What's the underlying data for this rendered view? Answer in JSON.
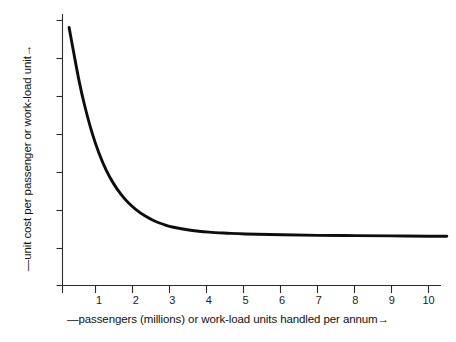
{
  "chart_data": {
    "type": "line",
    "title": "",
    "subtitle": "",
    "xlabel": "—passengers (millions) or work-load units handled per annum→",
    "ylabel": "—unit cost per passenger or work-load unit→",
    "xlabel_prefix_dash": "—",
    "xlabel_arrow": "→",
    "ylabel_prefix_dash": "—",
    "ylabel_arrow": "→",
    "grid": false,
    "legend": null,
    "legend_position": "none",
    "xlim": [
      0,
      10.8
    ],
    "ylim": [
      0,
      1
    ],
    "x_tick_labels": [
      "1",
      "2",
      "3",
      "4",
      "5",
      "6",
      "7",
      "8",
      "9",
      "10"
    ],
    "x_tick_values": [
      1,
      2,
      3,
      4,
      5,
      6,
      7,
      8,
      9,
      10
    ],
    "y_tick_labels": [
      "",
      "",
      "",
      "",
      "",
      "",
      "",
      ""
    ],
    "y_tick_count": 8,
    "y_axis_has_numeric_labels": false,
    "annotations": [],
    "series": [
      {
        "name": "unit cost curve",
        "color": "#0d0d0d",
        "line_width": 2.9,
        "x": [
          0.18,
          0.3,
          0.45,
          0.6,
          0.8,
          1.0,
          1.2,
          1.4,
          1.6,
          1.8,
          2.0,
          2.25,
          2.5,
          2.75,
          3.0,
          3.5,
          4.0,
          4.5,
          5.0,
          6.0,
          7.0,
          8.0,
          9.0,
          10.0,
          10.5
        ],
        "y": [
          0.952,
          0.864,
          0.757,
          0.667,
          0.567,
          0.487,
          0.424,
          0.375,
          0.336,
          0.305,
          0.281,
          0.257,
          0.239,
          0.226,
          0.216,
          0.204,
          0.197,
          0.193,
          0.19,
          0.187,
          0.185,
          0.184,
          0.183,
          0.182,
          0.182
        ]
      }
    ],
    "curve_description": "Monotonically decreasing convex curve asymptotically approaching a low constant unit cost; steep decline from 0 to about 2 million passengers, elbow near 2.5-3, essentially flat from 4 to 10."
  },
  "axes": {
    "y_axis_name": "vertical-axis",
    "x_axis_name": "horizontal-axis",
    "axis_color": "#2b2b2b"
  },
  "colors": {
    "background": "#ffffff",
    "ink": "#111111",
    "curve": "#0d0d0d",
    "axis": "#2b2b2b"
  }
}
